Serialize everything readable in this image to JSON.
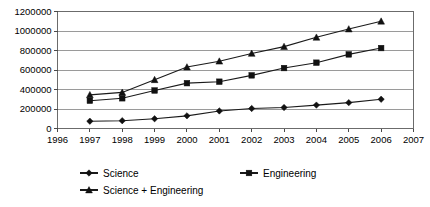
{
  "chart_data": {
    "type": "line",
    "title": "",
    "subtitle": "",
    "xlabel": "",
    "ylabel": "",
    "x": [
      1997,
      1998,
      1999,
      2000,
      2001,
      2002,
      2003,
      2004,
      2005,
      2006
    ],
    "xlim": [
      1996,
      2007
    ],
    "ylim": [
      0,
      1200000
    ],
    "grid": true,
    "legend_position": "bottom",
    "xtick_labels": [
      "1996",
      "1997",
      "1998",
      "1999",
      "2000",
      "2001",
      "2002",
      "2003",
      "2004",
      "2005",
      "2006",
      "2007"
    ],
    "ytick_labels": [
      "0",
      "200000",
      "400000",
      "600000",
      "800000",
      "1000000",
      "1200000"
    ],
    "ytick_values": [
      0,
      200000,
      400000,
      600000,
      800000,
      1000000,
      1200000
    ],
    "series": [
      {
        "name": "Science",
        "marker": "diamond",
        "values": [
          75000,
          80000,
          100000,
          130000,
          180000,
          205000,
          215000,
          240000,
          265000,
          300000
        ]
      },
      {
        "name": "Engineering",
        "marker": "square",
        "values": [
          285000,
          310000,
          390000,
          465000,
          480000,
          545000,
          620000,
          675000,
          760000,
          825000
        ]
      },
      {
        "name": "Science + Engineering",
        "marker": "triangle",
        "values": [
          345000,
          370000,
          500000,
          630000,
          690000,
          770000,
          840000,
          935000,
          1020000,
          1100000
        ]
      }
    ]
  },
  "legend": {
    "entries": [
      {
        "label": "Science",
        "marker": "diamond"
      },
      {
        "label": "Engineering",
        "marker": "square"
      },
      {
        "label": "Science + Engineering",
        "marker": "triangle"
      }
    ]
  },
  "colors": {
    "line": "#1a1a1a",
    "grid": "#9a9a9a",
    "frame": "#6b6b6b",
    "text": "#000000",
    "background": "#ffffff"
  }
}
